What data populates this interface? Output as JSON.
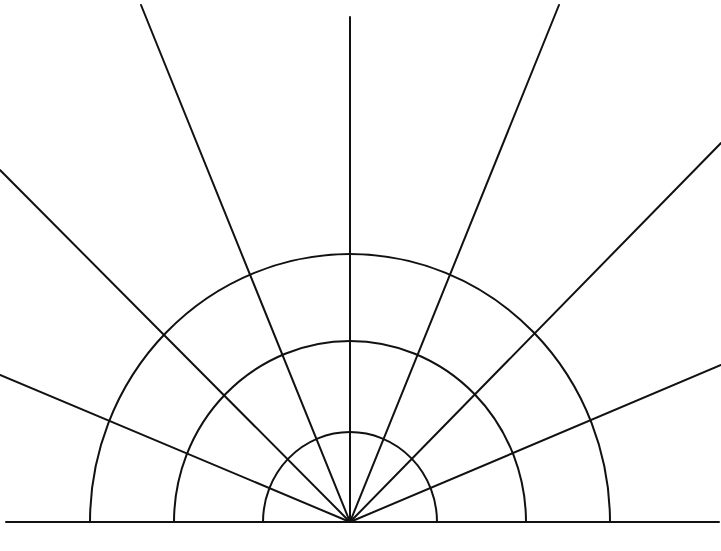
{
  "diagram": {
    "type": "radial-semicircle-grid",
    "background": "#ffffff",
    "stroke_color": "#111111",
    "center": {
      "x": 350,
      "y": 522
    },
    "baseline": {
      "x1": 6,
      "x2": 719,
      "y": 522
    },
    "arcs": [
      {
        "rx": 87,
        "ry": 90
      },
      {
        "rx": 176,
        "ry": 181
      },
      {
        "rx": 260,
        "ry": 268
      }
    ],
    "rays": [
      {
        "x": 0,
        "y": 170
      },
      {
        "x": 0,
        "y": 375
      },
      {
        "x": 141,
        "y": 5
      },
      {
        "x": 350,
        "y": 17
      },
      {
        "x": 559,
        "y": 5
      },
      {
        "x": 721,
        "y": 143
      },
      {
        "x": 721,
        "y": 365
      }
    ]
  }
}
